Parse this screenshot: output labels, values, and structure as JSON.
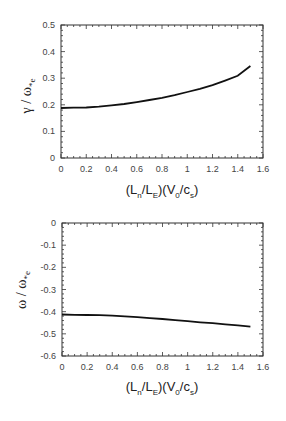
{
  "chart_data": [
    {
      "type": "line",
      "title": "",
      "xlabel": "(L_n/L_E)(V_0/c_s)",
      "ylabel": "γ / ω*e",
      "xlim": [
        0,
        1.6
      ],
      "ylim": [
        0,
        0.5
      ],
      "xticks": [
        "0",
        "0.2",
        "0.4",
        "0.6",
        "0.8",
        "1",
        "1.2",
        "1.4",
        "1.6"
      ],
      "yticks": [
        "0",
        "0.1",
        "0.2",
        "0.3",
        "0.4",
        "0.5"
      ],
      "grid": false,
      "series": [
        {
          "name": "growth rate",
          "x": [
            0,
            0.1,
            0.2,
            0.3,
            0.4,
            0.5,
            0.6,
            0.7,
            0.8,
            0.9,
            1.0,
            1.1,
            1.2,
            1.3,
            1.4,
            1.5
          ],
          "y": [
            0.188,
            0.189,
            0.19,
            0.193,
            0.198,
            0.203,
            0.21,
            0.218,
            0.226,
            0.236,
            0.248,
            0.26,
            0.274,
            0.291,
            0.309,
            0.346
          ]
        }
      ]
    },
    {
      "type": "line",
      "title": "",
      "xlabel": "(L_n/L_E)(V_0/c_s)",
      "ylabel": "ω / ω*e",
      "xlim": [
        0,
        1.6
      ],
      "ylim": [
        -0.6,
        0
      ],
      "xticks": [
        "0",
        "0.2",
        "0.4",
        "0.6",
        "0.8",
        "1",
        "1.2",
        "1.4",
        "1.6"
      ],
      "yticks": [
        "0",
        "-0.1",
        "-0.2",
        "-0.3",
        "-0.4",
        "-0.5",
        "-0.6"
      ],
      "grid": false,
      "series": [
        {
          "name": "real frequency",
          "x": [
            0,
            0.1,
            0.2,
            0.3,
            0.4,
            0.5,
            0.6,
            0.7,
            0.8,
            0.9,
            1.0,
            1.1,
            1.2,
            1.3,
            1.4,
            1.5
          ],
          "y": [
            -0.413,
            -0.414,
            -0.415,
            -0.416,
            -0.418,
            -0.421,
            -0.425,
            -0.429,
            -0.433,
            -0.438,
            -0.443,
            -0.448,
            -0.452,
            -0.457,
            -0.462,
            -0.468
          ]
        }
      ]
    }
  ],
  "top": {
    "ylabel_main": "γ / ω",
    "ylabel_sub": "*e",
    "xlabel": {
      "p1": "(L",
      "s1": "n",
      "p2": "/L",
      "s2": "E",
      "p3": ")(V",
      "s3": "0",
      "p4": "/c",
      "s4": "s",
      "p5": ")"
    }
  },
  "bottom": {
    "ylabel_main": "ω / ω",
    "ylabel_sub": "*e",
    "xlabel": {
      "p1": "(L",
      "s1": "n",
      "p2": "/L",
      "s2": "E",
      "p3": ")(V",
      "s3": "0",
      "p4": "/c",
      "s4": "s",
      "p5": ")"
    }
  }
}
